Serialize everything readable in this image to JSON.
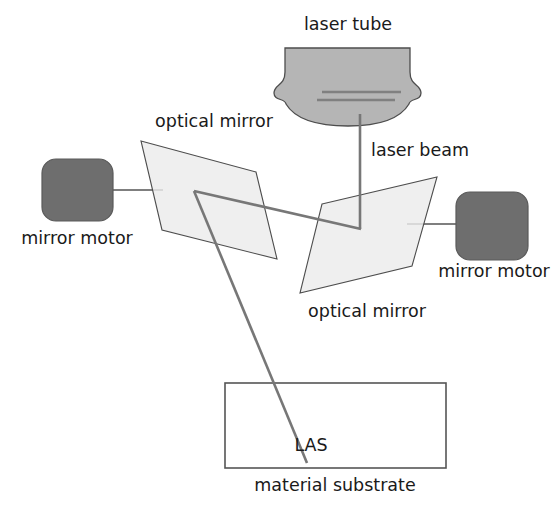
{
  "diagram": {
    "labels": {
      "laser_tube": "laser tube",
      "laser_beam": "laser beam",
      "optical_mirror_top": "optical mirror",
      "optical_mirror_bottom": "optical mirror",
      "mirror_motor_left": "mirror motor",
      "mirror_motor_right": "mirror motor",
      "las": "LAS",
      "material_substrate": "material substrate"
    },
    "colors": {
      "background": "#ffffff",
      "text": "#1a1a1a",
      "laser_tube_fill": "#b5b5b5",
      "laser_tube_stroke": "#4d4d4d",
      "laser_tube_inner_line": "#808080",
      "mirror_fill": "#ececec",
      "mirror_stroke": "#4d4d4d",
      "motor_fill": "#6e6e6e",
      "motor_stroke": "#5a5a5a",
      "beam_stroke": "#777777",
      "connector_stroke": "#555555",
      "substrate_stroke": "#555555",
      "substrate_fill": "#ffffff"
    },
    "shapes": {
      "laser_tube": {
        "name": "laser-tube",
        "path": "M 285 48 L 410 48 L 410 72 C 410 86 421 84 421 93 C 421 101 410 98 409 104 C 400 119 379 126 348 126 C 317 126 295 119 286 104 C 285 98 274 101 274 93 C 274 84 285 86 285 72 Z",
        "inner_lines": [
          {
            "name": "tube-inner-line-upper",
            "x1": 322,
            "y1": 92,
            "x2": 401,
            "y2": 92
          },
          {
            "name": "tube-inner-line-lower",
            "x1": 317,
            "y1": 100,
            "x2": 395,
            "y2": 100
          }
        ]
      },
      "optical_mirror_top": {
        "name": "optical-mirror-top",
        "points": "141,141 256,172 277,259 162,230"
      },
      "optical_mirror_bottom": {
        "name": "optical-mirror-bottom",
        "points": "322,204 437,177 412,266 300,293"
      },
      "mirror_motor_left": {
        "name": "mirror-motor-left-body",
        "x": 42,
        "y": 159,
        "width": 71,
        "height": 62,
        "rx": 14
      },
      "mirror_motor_right": {
        "name": "mirror-motor-right-body",
        "x": 456,
        "y": 192,
        "width": 72,
        "height": 68,
        "rx": 14
      },
      "material_substrate": {
        "name": "material-substrate-box",
        "x": 225,
        "y": 383,
        "width": 221,
        "height": 85
      },
      "connectors": [
        {
          "name": "connector-left-motor-to-mirror",
          "x1": 113,
          "y1": 190,
          "x2": 163,
          "y2": 190
        },
        {
          "name": "connector-right-motor-to-mirror",
          "x1": 407,
          "y1": 224,
          "x2": 456,
          "y2": 224
        }
      ],
      "beam_segments": [
        {
          "name": "beam-tube-to-lower-mirror",
          "x1": 360,
          "y1": 114,
          "x2": 360,
          "y2": 229
        },
        {
          "name": "beam-lower-mirror-to-upper-mirror",
          "x1": 360,
          "y1": 229,
          "x2": 194,
          "y2": 191
        },
        {
          "name": "beam-upper-mirror-to-substrate",
          "x1": 194,
          "y1": 191,
          "x2": 307,
          "y2": 463
        }
      ]
    },
    "label_positions": {
      "laser_tube": {
        "x": 348,
        "y": 16
      },
      "optical_mirror_top": {
        "x": 214,
        "y": 113
      },
      "laser_beam": {
        "x": 420,
        "y": 142
      },
      "mirror_motor_left": {
        "x": 77,
        "y": 230
      },
      "optical_mirror_bottom": {
        "x": 367,
        "y": 303
      },
      "mirror_motor_right": {
        "x": 494,
        "y": 263
      },
      "las": {
        "x": 311,
        "y": 437
      },
      "material_substrate": {
        "x": 335,
        "y": 477
      }
    }
  }
}
